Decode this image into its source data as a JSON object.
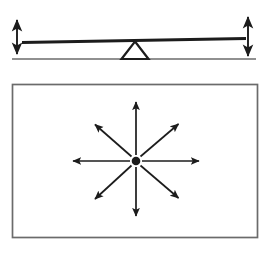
{
  "figure": {
    "title": "Lever with fulcrum above a rectangle containing radiating arrows",
    "background_color": "#ffffff",
    "ink_color": "#1c1c1c",
    "frame_color": "#6b6b6b",
    "width": 272,
    "height": 253,
    "panels": [
      {
        "name": "lever-panel",
        "label": "Lever and fulcrum",
        "elements": {
          "beam": {
            "label": "lever-beam",
            "x1": 22,
            "y1": 42,
            "x2": 246,
            "y2": 38,
            "thickness": 2.6
          },
          "ground": {
            "label": "ground-line",
            "x1": 12,
            "y1": 59,
            "x2": 256,
            "y2": 59,
            "thickness": 1.4
          },
          "fulcrum": {
            "label": "triangular-fulcrum",
            "apex_x": 135,
            "apex_y": 41,
            "base_left_x": 122,
            "base_right_x": 148,
            "base_y": 59
          },
          "left_arrow": {
            "label": "left-displacement-arrow",
            "direction": "double-headed-vertical",
            "x": 17,
            "y_top": 18,
            "y_bottom": 56
          },
          "right_arrow": {
            "label": "right-displacement-arrow",
            "direction": "double-headed-vertical",
            "x": 248,
            "y_top": 15,
            "y_bottom": 58
          }
        }
      },
      {
        "name": "radiating-panel",
        "label": "Rectangle with radiating arrows",
        "elements": {
          "rectangle": {
            "label": "bounding-rectangle",
            "x": 12,
            "y": 84,
            "width": 246,
            "height": 154,
            "thickness": 1.6
          },
          "center_dot": {
            "label": "center-point",
            "cx": 136,
            "cy": 161,
            "r": 4.2
          },
          "arrows": [
            {
              "label": "arrow-up",
              "direction": "up",
              "angle_deg": 90,
              "tip_x": 136,
              "tip_y": 100
            },
            {
              "label": "arrow-up-right",
              "direction": "up-right",
              "angle_deg": 45,
              "tip_x": 181,
              "tip_y": 121
            },
            {
              "label": "arrow-right",
              "direction": "right",
              "angle_deg": 0,
              "tip_x": 202,
              "tip_y": 161
            },
            {
              "label": "arrow-down-right",
              "direction": "down-right",
              "angle_deg": -45,
              "tip_x": 181,
              "tip_y": 201
            },
            {
              "label": "arrow-down",
              "direction": "down",
              "angle_deg": -90,
              "tip_x": 136,
              "tip_y": 219
            },
            {
              "label": "arrow-down-left",
              "direction": "down-left",
              "angle_deg": -135,
              "tip_x": 92,
              "tip_y": 202
            },
            {
              "label": "arrow-left",
              "direction": "left",
              "angle_deg": 180,
              "tip_x": 70,
              "tip_y": 161
            },
            {
              "label": "arrow-up-left",
              "direction": "up-left",
              "angle_deg": 135,
              "tip_x": 92,
              "tip_y": 122
            }
          ],
          "arrow_count": 8,
          "arrow_style": "solid-filled-head"
        }
      }
    ]
  }
}
